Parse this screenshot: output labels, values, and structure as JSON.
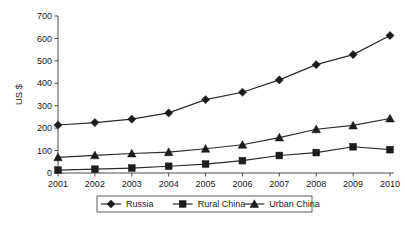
{
  "chart_data": {
    "type": "line",
    "title": "",
    "xlabel": "",
    "ylabel": "US $",
    "categories": [
      "2001",
      "2002",
      "2003",
      "2004",
      "2005",
      "2006",
      "2007",
      "2008",
      "2009",
      "2010"
    ],
    "ylim": [
      0,
      700
    ],
    "ytick_step": 100,
    "yticks": [
      "0",
      "100",
      "200",
      "300",
      "400",
      "500",
      "600",
      "700"
    ],
    "grid": false,
    "legend_position": "bottom",
    "series": [
      {
        "name": "Russia",
        "marker": "diamond",
        "color": "#1c1c1c",
        "values": [
          214,
          225,
          240,
          268,
          327,
          360,
          415,
          483,
          528,
          613
        ]
      },
      {
        "name": "Rural China",
        "marker": "square",
        "color": "#1c1c1c",
        "values": [
          13,
          17,
          22,
          30,
          40,
          55,
          78,
          91,
          117,
          104
        ]
      },
      {
        "name": "Urban China",
        "marker": "triangle",
        "color": "#1c1c1c",
        "values": [
          70,
          79,
          87,
          93,
          108,
          126,
          158,
          195,
          212,
          243
        ]
      }
    ]
  },
  "legend": {
    "entries": [
      {
        "label": "Russia"
      },
      {
        "label": "Rural China"
      },
      {
        "label": "Urban China"
      }
    ]
  },
  "axes": {
    "y_title": "US $"
  }
}
